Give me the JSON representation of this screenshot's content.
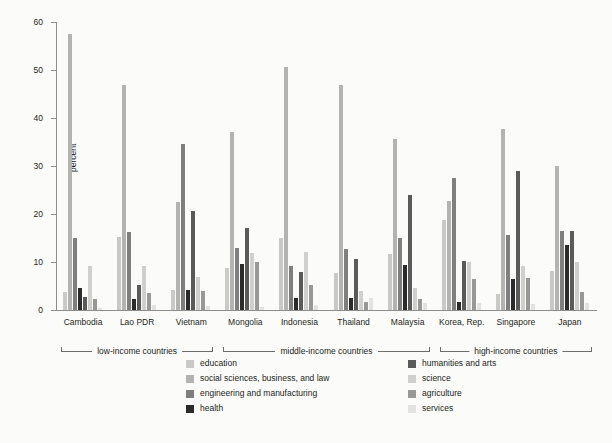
{
  "chart_data": {
    "type": "bar",
    "title": "",
    "xlabel": "",
    "ylabel": "percent",
    "ylim": [
      0,
      60
    ],
    "yticks": [
      0,
      10,
      20,
      30,
      40,
      50,
      60
    ],
    "grid": false,
    "legend_position": "bottom",
    "categories": [
      "Cambodia",
      "Lao PDR",
      "Vietnam",
      "Mongolia",
      "Indonesia",
      "Thailand",
      "Malaysia",
      "Korea, Rep.",
      "Singapore",
      "Japan"
    ],
    "series": [
      {
        "name": "education",
        "color": "#c9c9c7",
        "values": [
          3.8,
          15.2,
          4.1,
          8.7,
          15.0,
          7.7,
          11.7,
          18.8,
          3.4,
          8.2
        ]
      },
      {
        "name": "social sciences, business, and law",
        "color": "#b3b3b1",
        "values": [
          57.4,
          46.8,
          22.6,
          37.0,
          50.6,
          46.9,
          35.7,
          22.7,
          37.8,
          29.9
        ]
      },
      {
        "name": "engineering and manufacturing",
        "color": "#7f7f7f",
        "values": [
          14.9,
          16.3,
          34.6,
          13.0,
          9.1,
          12.7,
          15.0,
          27.5,
          15.6,
          16.4
        ]
      },
      {
        "name": "health",
        "color": "#2b2b2b",
        "values": [
          4.5,
          2.3,
          4.2,
          9.5,
          2.4,
          2.4,
          9.3,
          1.6,
          6.5,
          13.5
        ]
      },
      {
        "name": "humanities and arts",
        "color": "#5a5a5a",
        "values": [
          2.7,
          5.2,
          20.6,
          17.1,
          8.0,
          10.6,
          24.0,
          10.3,
          28.9,
          16.4
        ]
      },
      {
        "name": "science",
        "color": "#cfcfcd",
        "values": [
          9.2,
          9.1,
          6.9,
          11.8,
          12.0,
          4.0,
          4.6,
          10.1,
          9.1,
          10.0
        ]
      },
      {
        "name": "agriculture",
        "color": "#989896",
        "values": [
          2.3,
          3.6,
          3.9,
          9.9,
          5.2,
          1.6,
          2.3,
          6.5,
          6.6,
          3.8
        ]
      },
      {
        "name": "services",
        "color": "#e2e2e0",
        "values": [
          0.5,
          1.0,
          0.8,
          0.7,
          1.0,
          2.4,
          1.5,
          1.4,
          1.2,
          1.4
        ]
      }
    ],
    "income_groups": [
      {
        "label": "low-income countries",
        "members": [
          "Cambodia",
          "Lao PDR",
          "Vietnam"
        ]
      },
      {
        "label": "middle-income countries",
        "members": [
          "Mongolia",
          "Indonesia",
          "Thailand",
          "Malaysia"
        ]
      },
      {
        "label": "high-income countries",
        "members": [
          "Korea, Rep.",
          "Singapore",
          "Japan"
        ]
      }
    ]
  },
  "axis": {
    "y_title": "percent"
  },
  "colors": {
    "background": "#fbfbfa",
    "axis": "#8d8d8d",
    "text": "#231f20"
  }
}
